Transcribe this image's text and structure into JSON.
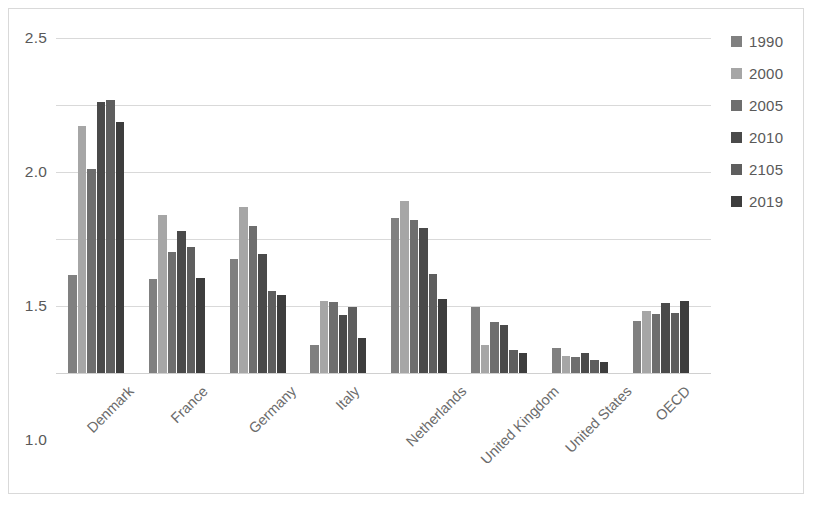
{
  "chart_data": {
    "type": "bar",
    "title": "",
    "xlabel": "",
    "ylabel": "",
    "ylim": [
      0,
      2.5
    ],
    "ytick_labels": [
      "0.0",
      "0.5",
      "1.0",
      "1.5",
      "2.0",
      "2.5"
    ],
    "ytick_values": [
      0,
      0.5,
      1.0,
      1.5,
      2.0,
      2.5
    ],
    "grid": true,
    "legend_position": "right",
    "categories": [
      "Denmark",
      "France",
      "Germany",
      "Italy",
      "Netherlands",
      "United Kingdom",
      "United States",
      "OECD"
    ],
    "series": [
      {
        "name": "1990",
        "color": "#808080",
        "values": [
          0.73,
          0.7,
          0.85,
          0.21,
          1.16,
          0.49,
          0.19,
          0.39
        ]
      },
      {
        "name": "2000",
        "color": "#a6a6a6",
        "values": [
          1.84,
          1.18,
          1.24,
          0.54,
          1.28,
          0.21,
          0.13,
          0.46
        ]
      },
      {
        "name": "2005",
        "color": "#6e6e6e",
        "values": [
          1.52,
          0.9,
          1.1,
          0.53,
          1.14,
          0.38,
          0.12,
          0.44
        ]
      },
      {
        "name": "2010",
        "color": "#4a4a4a",
        "values": [
          2.02,
          1.06,
          0.89,
          0.43,
          1.08,
          0.36,
          0.15,
          0.52
        ]
      },
      {
        "name": "2105",
        "color": "#5e5e5e",
        "values": [
          2.04,
          0.94,
          0.61,
          0.49,
          0.74,
          0.17,
          0.1,
          0.45
        ]
      },
      {
        "name": "2019",
        "color": "#3d3d3d",
        "values": [
          1.87,
          0.71,
          0.58,
          0.26,
          0.55,
          0.15,
          0.08,
          0.54
        ]
      }
    ]
  },
  "legend": {
    "items": [
      {
        "label": "1990",
        "color": "#808080"
      },
      {
        "label": "2000",
        "color": "#a6a6a6"
      },
      {
        "label": "2005",
        "color": "#6e6e6e"
      },
      {
        "label": "2010",
        "color": "#4a4a4a"
      },
      {
        "label": "2105",
        "color": "#5e5e5e"
      },
      {
        "label": "2019",
        "color": "#3d3d3d"
      }
    ]
  }
}
